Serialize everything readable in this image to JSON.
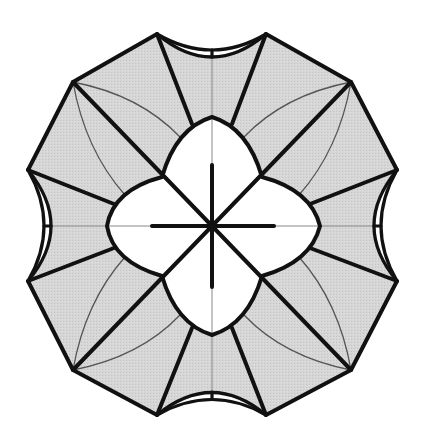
{
  "diagram": {
    "kind": "origami-crease-pattern",
    "colors": {
      "background": "#ffffff",
      "paper_shaded": "#d4d4d4",
      "paper_white": "#ffffff",
      "fold_line": "#111111",
      "thin_crease": "#555555",
      "hairline": "#888888"
    },
    "center": [
      212,
      226
    ],
    "outer_vertices": [
      [
        157,
        34
      ],
      [
        266,
        34
      ],
      [
        351,
        82
      ],
      [
        397,
        170
      ],
      [
        397,
        281
      ],
      [
        351,
        370
      ],
      [
        266,
        415
      ],
      [
        157,
        415
      ],
      [
        73,
        370
      ],
      [
        28,
        281
      ],
      [
        28,
        170
      ],
      [
        73,
        82
      ]
    ],
    "inner_petal_tips": {
      "top": [
        212,
        117
      ],
      "right": [
        320,
        226
      ],
      "bottom": [
        212,
        335
      ],
      "left": [
        107,
        226
      ]
    },
    "inner_junctions": [
      [
        162,
        177
      ],
      [
        262,
        177
      ],
      [
        262,
        276
      ],
      [
        162,
        276
      ]
    ],
    "notches": [
      "top",
      "right",
      "bottom",
      "left"
    ]
  }
}
